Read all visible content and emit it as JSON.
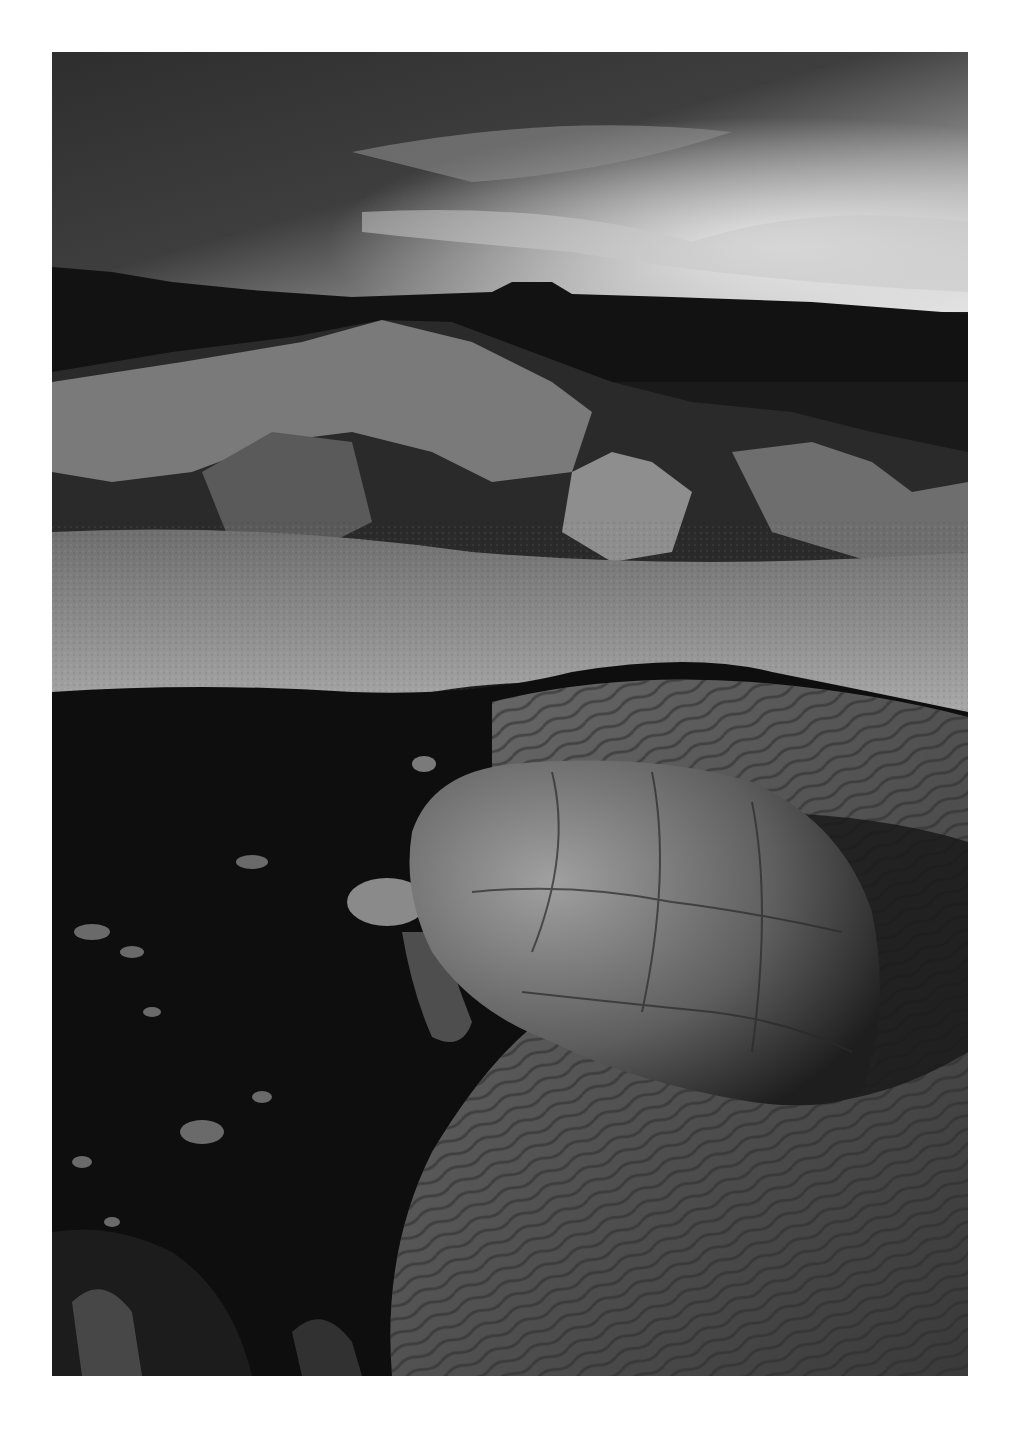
{
  "image": {
    "alt": "Black-and-white photograph of a giant tortoise resting in a shallow rippled pool beneath rocky volcanic terrain and a dramatic cloudy sky",
    "palette": {
      "page_background": "#ffffff",
      "sky_dark": "#3a3a3a",
      "sky_light": "#d8d8d8",
      "ridge": "#121212",
      "rocks_lit": "#8a8a8a",
      "ground": "#9a9a9a",
      "pool_dark": "#0e0e0e",
      "water": "#4a4a4a",
      "shell": "#7c7c7c"
    }
  }
}
